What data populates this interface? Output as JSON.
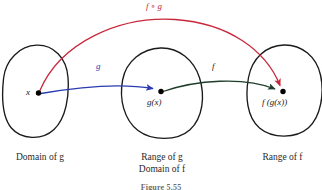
{
  "figure": {
    "caption": "Figure 5.55",
    "background_color": "#ffffff"
  },
  "colors": {
    "oval_stroke": "#1a1a1a",
    "point_fill": "#000000",
    "arrow_g": "#2a3bb0",
    "arrow_f": "#1f3d2b",
    "arrow_composite": "#c8283c",
    "text": "#1a1a1a",
    "caption_text": "#2a2a2a"
  },
  "sets": [
    {
      "id": "domain-of-g",
      "caption": "Domain of g",
      "caption_line2": "",
      "point_label": "x"
    },
    {
      "id": "range-of-g-domain-of-f",
      "caption": "Range of g",
      "caption_line2": "Domain of f",
      "point_label": "g(x)"
    },
    {
      "id": "range-of-f",
      "caption": "Range of f",
      "caption_line2": "",
      "point_label": "f (g(x))"
    }
  ],
  "arrows": [
    {
      "id": "arrow-g",
      "label": "g",
      "color": "#2a3bb0",
      "from": "x",
      "to": "g(x)"
    },
    {
      "id": "arrow-f",
      "label": "f",
      "color": "#1f3d2b",
      "from": "g(x)",
      "to": "f (g(x))"
    },
    {
      "id": "arrow-composite",
      "label": "f ∘ g",
      "color": "#c8283c",
      "from": "x",
      "to": "f (g(x))"
    }
  ]
}
